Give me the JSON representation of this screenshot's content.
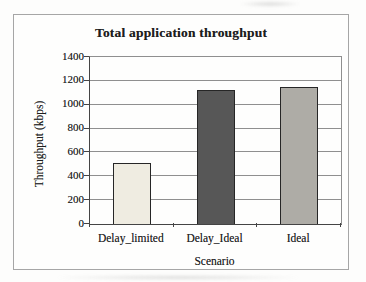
{
  "page": {
    "background_color": "#fdfdfc",
    "frame_border_color": "#a6a6a6"
  },
  "chart_data": {
    "type": "bar",
    "title": "Total application throughput",
    "categories": [
      "Delay_limited",
      "Delay_Ideal",
      "Ideal"
    ],
    "values": [
      510,
      1120,
      1150
    ],
    "xlabel": "Scenario",
    "ylabel": "Throughput (kbps)",
    "ylim": [
      0,
      1400
    ],
    "yticks": [
      0,
      200,
      400,
      600,
      800,
      1000,
      1200,
      1400
    ],
    "grid": true,
    "legend_position": "none",
    "bar_colors": [
      "#efece1",
      "#575757",
      "#aeaca6"
    ],
    "bar_border_color": "#262626",
    "gridline_color": "#8f8f8f",
    "axis_color": "#444444",
    "text_color": "#1e1e1e"
  }
}
